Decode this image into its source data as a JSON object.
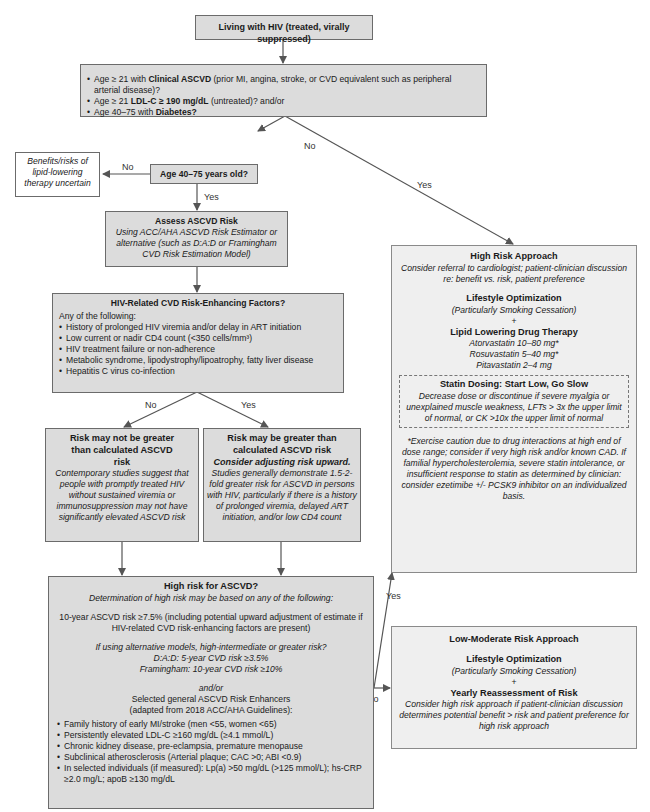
{
  "start": {
    "title": "Living with HIV (treated, virally suppressed)"
  },
  "criteria": {
    "items": [
      {
        "pre": "Age ≥ 21 with ",
        "bold": "Clinical ASCVD",
        "post": " (prior MI, angina, stroke, or CVD equivalent such as peripheral arterial disease)?"
      },
      {
        "pre": "Age ≥ 21 ",
        "bold": "LDL-C ≥ 190 mg/dL",
        "post": " (untreated)? and/or"
      },
      {
        "pre": "Age 40–75 with ",
        "bold": "Diabetes?",
        "post": ""
      }
    ]
  },
  "labels": {
    "no": "No",
    "yes": "Yes"
  },
  "uncertain": {
    "text": "Benefits/risks of lipid-lowering therapy uncertain"
  },
  "age_question": {
    "title": "Age 40–75 years old?"
  },
  "assess": {
    "title": "Assess ASCVD Risk",
    "desc": "Using ACC/AHA ASCVD Risk Estimator or alternative (such as D:A:D or Framingham CVD Risk Estimation Model)"
  },
  "hiv_factors": {
    "title": "HIV-Related CVD Risk-Enhancing Factors?",
    "intro": "Any of the following:",
    "items": [
      "History of prolonged HIV viremia and/or delay in ART initiation",
      "Low current or nadir CD4 count (<350 cells/mm³)",
      "HIV treatment failure or non-adherence",
      "Metabolic syndrome, lipodystrophy/lipoatrophy, fatty liver disease",
      "Hepatitis C virus co-infection"
    ]
  },
  "not_greater": {
    "title": "Risk may not be greater than calculated ASCVD risk",
    "desc": "Contemporary studies suggest that people with promptly treated HIV without sustained viremia or immunosuppression may not have significantly elevated ASCVD risk"
  },
  "greater": {
    "title": "Risk may be greater than calculated ASCVD risk",
    "subtitle": "Consider adjusting risk upward.",
    "desc": "Studies generally demonstrate 1.5-2-fold greater risk for ASCVD in persons with HIV, particularly if there is a history of prolonged viremia, delayed ART initiation, and/or low CD4 count"
  },
  "high_risk_q": {
    "title": "High risk for ASCVD?",
    "subtitle": "Determination of high risk may be based on any of the following:",
    "ten_year": "10-year ASCVD risk ≥7.5% (including potential upward adjustment of estimate if HIV-related CVD risk-enhancing factors are present)",
    "alt_models": "If using alternative models, high-intermediate or greater risk?",
    "dad": "D:A:D: 5-year CVD risk ≥3.5%",
    "framingham": "Framingham: 10-year CVD risk ≥10%",
    "andor": "and/or",
    "enhancers_title": "Selected general ASCVD Risk Enhancers",
    "enhancers_source": "(adapted from 2018 ACC/AHA Guidelines):",
    "enhancers": [
      "Family history of early MI/stroke (men <55, women <65)",
      "Persistently elevated LDL-C ≥160 mg/dL (≥4.1 mmol/L)",
      "Chronic kidney disease, pre-eclampsia, premature menopause",
      "Subclinical atherosclerosis (Arterial plaque; CAC >0; ABI <0.9)",
      "In selected individuals (if measured): Lp(a) >50 mg/dL (>125 mmol/L); hs-CRP ≥2.0 mg/L; apoB ≥130 mg/dL"
    ]
  },
  "high_approach": {
    "title": "High Risk Approach",
    "desc": "Consider referral to cardiologist; patient-clinician discussion re: benefit vs. risk, patient preference",
    "lifestyle_title": "Lifestyle Optimization",
    "lifestyle_desc": "(Particularly Smoking Cessation)",
    "plus": "+",
    "drug_title": "Lipid Lowering Drug Therapy",
    "drugs": [
      "Atorvastatin 10–80 mg*",
      "Rosuvastatin 5–40 mg*",
      "Pitavastatin 2–4 mg"
    ],
    "dosing_title": "Statin Dosing: Start Low, Go Slow",
    "dosing_desc": "Decrease dose or discontinue if severe myalgia or unexplained muscle weakness, LFTs > 3x the upper limit of normal, or CK >10x the upper limit of normal",
    "footnote": "*Exercise caution due to drug interactions at high end of dose range; consider if very high risk and/or known CAD. If familial hypercholesterolemia, severe statin intolerance, or insufficient response to statin as determined by clinician: consider ezetimibe +/- PCSK9 inhibitor on an individualized basis."
  },
  "low_approach": {
    "title": "Low-Moderate Risk Approach",
    "lifestyle_title": "Lifestyle Optimization",
    "lifestyle_desc": "(Particularly Smoking Cessation)",
    "plus": "+",
    "reassess_title": "Yearly Reassessment of Risk",
    "reassess_desc": "Consider high risk approach if patient-clinician discussion determines potential benefit > risk and patient preference for high risk approach"
  }
}
